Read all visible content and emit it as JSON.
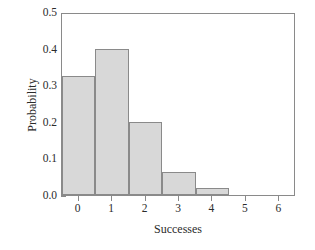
{
  "chart_data": {
    "type": "bar",
    "title": "",
    "xlabel": "Successes",
    "ylabel": "Probability",
    "categories": [
      "0",
      "1",
      "2",
      "3",
      "4",
      "5",
      "6"
    ],
    "values": [
      0.325,
      0.4,
      0.2,
      0.063,
      0.02,
      0.0,
      0.0
    ],
    "xlim": [
      -0.5,
      6.5
    ],
    "ylim": [
      0.0,
      0.5
    ],
    "ytick_labels": [
      "0.0",
      "0.1",
      "0.2",
      "0.3",
      "0.4",
      "0.5"
    ],
    "ytick_values": [
      0.0,
      0.1,
      0.2,
      0.3,
      0.4,
      0.5
    ],
    "xtick_labels": [
      "0",
      "1",
      "2",
      "3",
      "4",
      "5",
      "6"
    ],
    "xtick_values": [
      0,
      1,
      2,
      3,
      4,
      5,
      6
    ],
    "grid": false,
    "legend": false,
    "bar_fill_color": "#d8d8d8",
    "bar_edge_color": "#8a8a8a",
    "axis_color": "#8a8a8a",
    "text_color": "#2b2b2b",
    "background_color": "#ffffff",
    "bar_width": 1.0
  }
}
